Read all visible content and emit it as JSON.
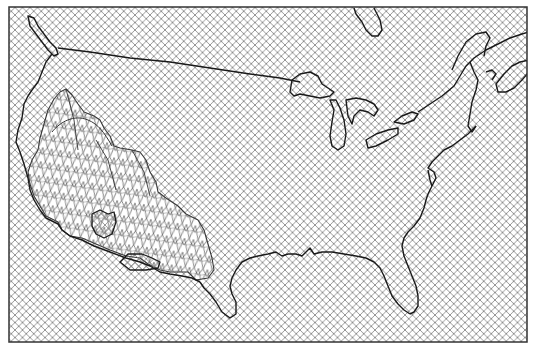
{
  "map": {
    "subject": "Contiguous United States outline map",
    "projection_frame": {
      "x": 9,
      "y": 7,
      "width": 518,
      "height": 335
    },
    "background_pattern": "diagonal-crosshatch",
    "highlight_region": {
      "name": "southwest-wireframe-surface",
      "style": "3D mesh / wireframe surface"
    },
    "features": [
      "us-coastline",
      "canada-border",
      "great-lakes",
      "florida-peninsula",
      "gulf-coast",
      "atlantic-coast",
      "pacific-coast",
      "hudson-bay-corner",
      "vancouver-island",
      "nova-scotia"
    ],
    "colors": {
      "background": "#ffffff",
      "hatch": "#8a8a8a",
      "outline": "#1a1a1a",
      "mesh": "#555555"
    }
  }
}
